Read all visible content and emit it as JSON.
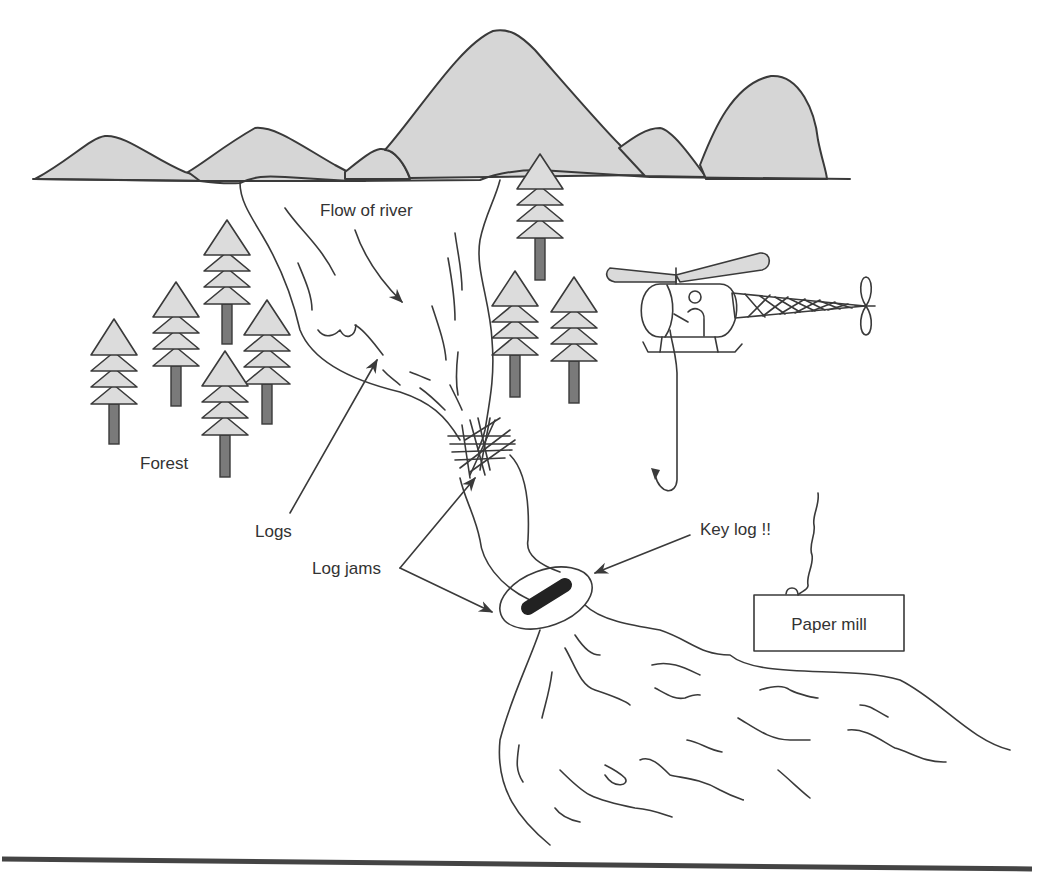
{
  "diagram": {
    "colors": {
      "ink": "#3a3a3a",
      "mountain_fill": "#d6d6d6",
      "tree_crown_fill": "#dcdcdc",
      "tree_trunk_fill": "#7a7a7a",
      "key_log_fill": "#222222",
      "rotor_fill": "#dadada",
      "background": "#ffffff"
    },
    "labels": {
      "flow": "Flow of river",
      "forest": "Forest",
      "logs": "Logs",
      "log_jams": "Log jams",
      "key_log": "Key log !!",
      "paper_mill": "Paper mill"
    },
    "elements": {
      "mountains": "mountain-range",
      "trees_left_count": 6,
      "trees_right_count": 3,
      "helicopter": "helicopter-with-hook",
      "river": "river",
      "upper_log_jam": "tangled-logs",
      "key_log": "key-log-circled",
      "paper_mill": "paper-mill-building"
    }
  }
}
